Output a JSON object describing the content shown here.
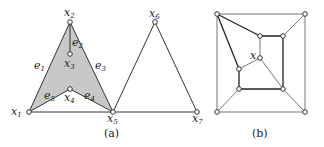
{
  "figure": {
    "panel_a": {
      "caption": "(a)",
      "nodes": [
        {
          "id": "x1",
          "base": "x",
          "sub": "1"
        },
        {
          "id": "x2",
          "base": "x",
          "sub": "2"
        },
        {
          "id": "x3",
          "base": "x",
          "sub": "3"
        },
        {
          "id": "x4",
          "base": "x",
          "sub": "4"
        },
        {
          "id": "x5",
          "base": "x",
          "sub": "5"
        },
        {
          "id": "x6",
          "base": "x",
          "sub": "6"
        },
        {
          "id": "x7",
          "base": "x",
          "sub": "7"
        }
      ],
      "edges": [
        {
          "id": "e1",
          "base": "e",
          "sub": "1"
        },
        {
          "id": "e2",
          "base": "e",
          "sub": "2"
        },
        {
          "id": "e3",
          "base": "e",
          "sub": "3"
        },
        {
          "id": "e4",
          "base": "e",
          "sub": "4"
        },
        {
          "id": "e5",
          "base": "e",
          "sub": "5"
        }
      ],
      "shaded_region_color": "#c8c8c8"
    },
    "panel_b": {
      "caption": "(b)",
      "center_label": "x"
    }
  }
}
